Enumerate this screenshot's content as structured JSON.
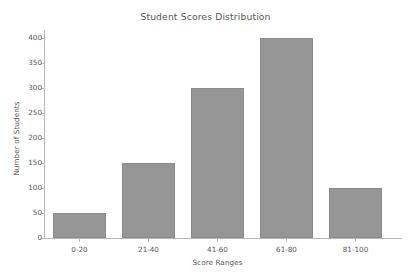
{
  "chart_data": {
    "type": "bar",
    "title": "Student Scores Distribution",
    "xlabel": "Score Ranges",
    "ylabel": "Number of Students",
    "categories": [
      "0-20",
      "21-40",
      "41-60",
      "61-80",
      "81-100"
    ],
    "values": [
      50,
      150,
      300,
      400,
      100
    ],
    "ylim": [
      0,
      400
    ],
    "yticks": [
      0,
      50,
      100,
      150,
      200,
      250,
      300,
      350,
      400
    ],
    "ytick_labels": [
      "0",
      "50",
      "100",
      "150",
      "200",
      "250",
      "300",
      "350",
      "400"
    ],
    "grid": false,
    "legend": null,
    "bar_color": "#969696",
    "bar_edge_color": "#8a8a8a",
    "text_color": "#555555",
    "axis_color": "#b8b8b8",
    "background": "#ffffff"
  }
}
